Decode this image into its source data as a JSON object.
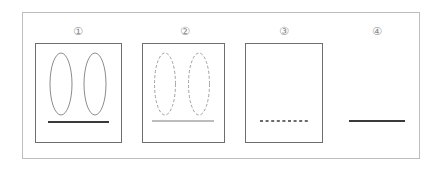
{
  "diagram": {
    "steps": [
      {
        "label": "①",
        "has_panel": true,
        "ellipses": "solid",
        "line": "thick-solid"
      },
      {
        "label": "②",
        "has_panel": true,
        "ellipses": "dashed",
        "line": "thin-solid"
      },
      {
        "label": "③",
        "has_panel": true,
        "ellipses": "none",
        "line": "dotted"
      },
      {
        "label": "④",
        "has_panel": false,
        "ellipses": "none",
        "line": "thick-solid"
      }
    ],
    "colors": {
      "frame": "#bdbdbd",
      "panel_border": "#6e6e6e",
      "ellipse_solid": "#8c8c8c",
      "ellipse_dashed": "#a0a0a0",
      "line_thick": "#3a3a3a",
      "line_thin": "#7a7a7a",
      "line_dotted": "#3a3a3a",
      "label": "#8a8a8a"
    }
  }
}
